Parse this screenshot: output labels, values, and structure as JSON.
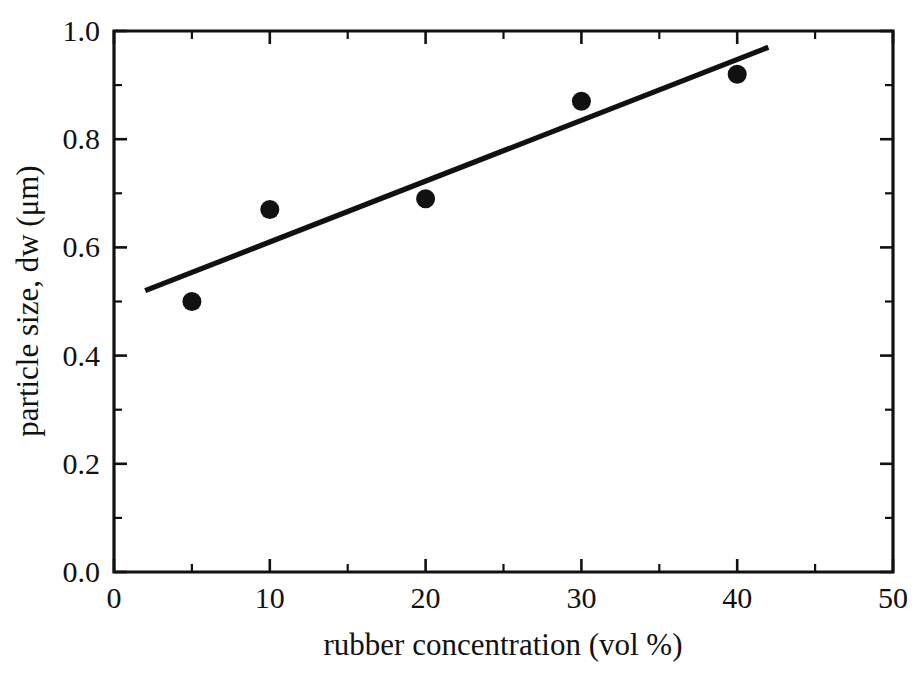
{
  "chart_data": {
    "type": "scatter",
    "title": "",
    "xlabel": "rubber concentration (vol %)",
    "ylabel": "particle size, dw (μm)",
    "xlim": [
      0,
      50
    ],
    "ylim": [
      0.0,
      1.0
    ],
    "grid": false,
    "legend": "none",
    "marker_style": "filled-circle",
    "marker_color": "#111111",
    "line_color": "#111111",
    "x": [
      5,
      10,
      20,
      30,
      40
    ],
    "y": [
      0.5,
      0.67,
      0.69,
      0.87,
      0.92
    ],
    "points": [
      {
        "x": 5,
        "y": 0.5
      },
      {
        "x": 10,
        "y": 0.67
      },
      {
        "x": 20,
        "y": 0.69
      },
      {
        "x": 30,
        "y": 0.87
      },
      {
        "x": 40,
        "y": 0.92
      }
    ],
    "trendline": {
      "type": "linear-fit",
      "x_start": 2.0,
      "y_start": 0.52,
      "x_end": 42.0,
      "y_end": 0.97
    },
    "xticks": [
      0,
      10,
      20,
      30,
      40,
      50
    ],
    "xtick_labels": [
      "0",
      "10",
      "20",
      "30",
      "40",
      "50"
    ],
    "xminor_ticks": [
      5,
      15,
      25,
      35,
      45
    ],
    "yticks": [
      0.0,
      0.2,
      0.4,
      0.6,
      0.8,
      1.0
    ],
    "ytick_labels": [
      "0.0",
      "0.2",
      "0.4",
      "0.6",
      "0.8",
      "1.0"
    ],
    "yminor_ticks": [
      0.1,
      0.3,
      0.5,
      0.7,
      0.9
    ]
  }
}
